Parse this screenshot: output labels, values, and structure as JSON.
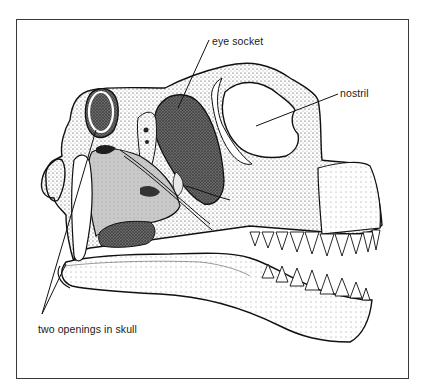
{
  "figure": {
    "border_color": "#3a3a3a",
    "labels": {
      "eye_socket": "eye socket",
      "nostril": "nostril",
      "two_openings": "two openings in skull"
    }
  }
}
